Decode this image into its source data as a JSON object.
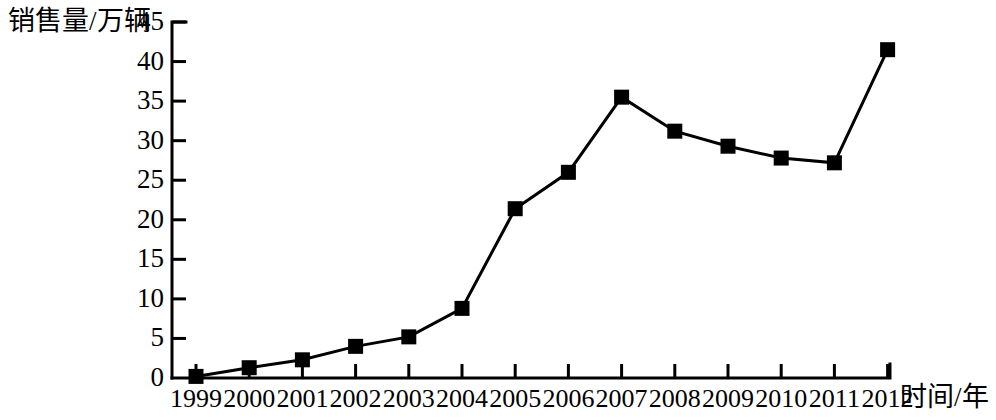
{
  "chart_data": {
    "type": "line",
    "title": "",
    "xlabel": "时间/年",
    "ylabel": "销售量/万辆",
    "categories": [
      "1999",
      "2000",
      "2001",
      "2002",
      "2003",
      "2004",
      "2005",
      "2006",
      "2007",
      "2008",
      "2009",
      "2010",
      "2011",
      "2012"
    ],
    "values": [
      0.2,
      1.3,
      2.3,
      4.0,
      5.2,
      8.8,
      21.4,
      26.0,
      35.5,
      31.2,
      29.3,
      27.8,
      27.2,
      41.5
    ],
    "series": [
      {
        "name": "销售量",
        "values": [
          0.2,
          1.3,
          2.3,
          4.0,
          5.2,
          8.8,
          21.4,
          26.0,
          35.5,
          31.2,
          29.3,
          27.8,
          27.2,
          41.5
        ]
      }
    ],
    "ylim": [
      0,
      45
    ],
    "yticks": [
      0,
      5,
      10,
      15,
      20,
      25,
      30,
      35,
      40,
      45
    ],
    "ytick_labels": [
      "0",
      "5",
      "10",
      "15",
      "20",
      "25",
      "30",
      "35",
      "40",
      "45"
    ],
    "xtick_labels": [
      "1999",
      "2000",
      "2001",
      "2002",
      "2003",
      "2004",
      "2005",
      "2006",
      "2007",
      "2008",
      "2009",
      "2010",
      "2011",
      "2012"
    ],
    "grid": false,
    "legend": false,
    "legend_position": "none",
    "marker": "square",
    "line_color": "#000000",
    "marker_color": "#000000",
    "background_color": "#ffffff"
  },
  "axes": {
    "y_title": "销售量/万辆",
    "x_title": "时间/年"
  }
}
